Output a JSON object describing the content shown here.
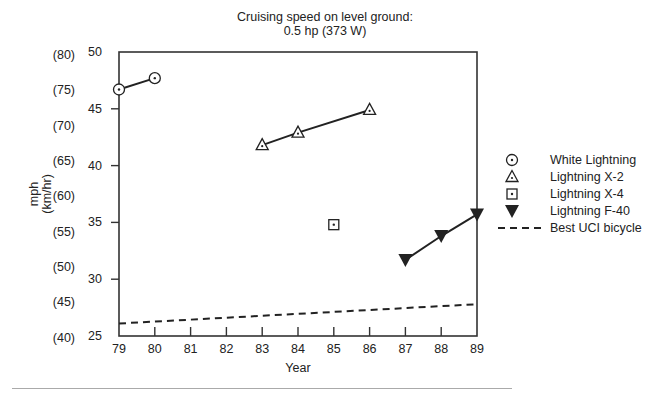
{
  "title": {
    "line1": "Cruising speed on level ground:",
    "line2": "0.5 hp (373 W)"
  },
  "axes": {
    "xlabel": "Year",
    "ylabel_line1": "mph",
    "ylabel_line2": "(km/hr)",
    "x_ticks": [
      "79",
      "80",
      "81",
      "82",
      "83",
      "84",
      "85",
      "86",
      "87",
      "88",
      "89"
    ],
    "y_ticks_mph": [
      "25",
      "30",
      "35",
      "40",
      "45",
      "50"
    ],
    "y_ticks_kmh": [
      "(40)",
      "(45)",
      "(50)",
      "(55)",
      "(60)",
      "(65)",
      "(70)",
      "(75)",
      "(80)"
    ]
  },
  "legend": {
    "items": [
      {
        "label": "White Lightning",
        "symbol": "circle-dot-icon"
      },
      {
        "label": "Lightning X-2",
        "symbol": "triangle-dot-icon"
      },
      {
        "label": "Lightning X-4",
        "symbol": "square-dot-icon"
      },
      {
        "label": "Lightning F-40",
        "symbol": "filled-down-triangle-icon"
      },
      {
        "label": "Best UCI bicycle",
        "symbol": "dashed-line-icon"
      }
    ]
  },
  "chart_data": {
    "type": "line",
    "title": "Cruising speed on level ground: 0.5 hp (373 W)",
    "xlabel": "Year",
    "ylabel": "mph (km/hr)",
    "xlim": [
      79,
      89
    ],
    "ylim": [
      25,
      50
    ],
    "secondary_ylabel_ticks_kmh": [
      40,
      45,
      50,
      55,
      60,
      65,
      70,
      75,
      80
    ],
    "grid": false,
    "legend_position": "right",
    "series": [
      {
        "name": "White Lightning",
        "marker": "circle-dot",
        "x": [
          79,
          80
        ],
        "y": [
          46.7,
          47.7
        ]
      },
      {
        "name": "Lightning X-2",
        "marker": "triangle-dot",
        "x": [
          83,
          84,
          86
        ],
        "y": [
          41.8,
          42.9,
          44.9
        ]
      },
      {
        "name": "Lightning X-4",
        "marker": "square-dot",
        "x": [
          85
        ],
        "y": [
          34.8
        ]
      },
      {
        "name": "Lightning F-40",
        "marker": "filled-down-triangle",
        "x": [
          87,
          88,
          89
        ],
        "y": [
          31.7,
          33.8,
          35.7
        ]
      },
      {
        "name": "Best UCI bicycle",
        "marker": "none",
        "linestyle": "dashed",
        "x": [
          79,
          89
        ],
        "y": [
          26.1,
          27.8
        ]
      }
    ]
  }
}
